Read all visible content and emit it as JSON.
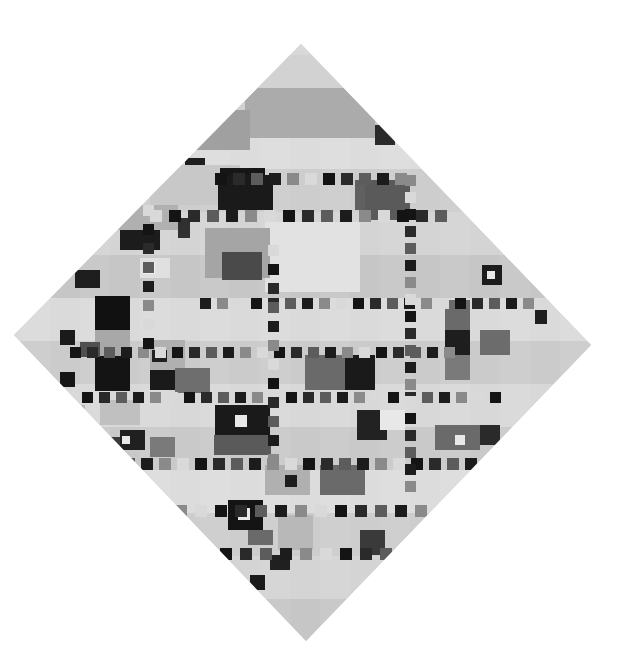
{
  "artwork": {
    "shape": "diamond",
    "style": "grayscale abstract grid of rectangles and small squares",
    "diamond_vertices": {
      "top": [
        301,
        44
      ],
      "right": [
        591,
        345
      ],
      "bottom": [
        306,
        641
      ],
      "left": [
        14,
        335
      ]
    },
    "base_color": "#cfcfcf",
    "palette": {
      "white": "#e6e6e6",
      "light": "#d6d6d6",
      "mid": "#b4b4b4",
      "gray": "#8c8c8c",
      "dark": "#5a5a5a",
      "black": "#1c1c1c"
    }
  },
  "blocks": [
    [
      228,
      55,
      150,
      60,
      "#d2d2d2"
    ],
    [
      245,
      88,
      130,
      50,
      "#ababab"
    ],
    [
      190,
      110,
      60,
      40,
      "#a0a0a0"
    ],
    [
      375,
      125,
      20,
      20,
      "#2a2a2a"
    ],
    [
      185,
      158,
      20,
      15,
      "#1e1e1e"
    ],
    [
      150,
      165,
      90,
      40,
      "#c8c8c8"
    ],
    [
      220,
      168,
      45,
      35,
      "#161616"
    ],
    [
      218,
      175,
      55,
      35,
      "#1a1a1a"
    ],
    [
      355,
      180,
      50,
      30,
      "#606060"
    ],
    [
      365,
      180,
      45,
      40,
      "#5a5a5a"
    ],
    [
      118,
      205,
      60,
      25,
      "#b0b0b0"
    ],
    [
      120,
      230,
      40,
      20,
      "#1c1c1c"
    ],
    [
      178,
      218,
      12,
      20,
      "#303030"
    ],
    [
      265,
      222,
      95,
      70,
      "#e2e2e2"
    ],
    [
      205,
      228,
      65,
      50,
      "#a5a5a5"
    ],
    [
      222,
      252,
      40,
      28,
      "#4a4a4a"
    ],
    [
      140,
      258,
      30,
      20,
      "#e0e0e0"
    ],
    [
      143,
      262,
      12,
      12,
      "#f0f0f0"
    ],
    [
      75,
      270,
      25,
      18,
      "#1e1e1e"
    ],
    [
      95,
      296,
      30,
      32,
      "#161616"
    ],
    [
      95,
      296,
      35,
      35,
      "#111111"
    ],
    [
      95,
      330,
      35,
      30,
      "#a8a8a8"
    ],
    [
      95,
      356,
      35,
      35,
      "#141414"
    ],
    [
      60,
      330,
      15,
      15,
      "#1a1a1a"
    ],
    [
      80,
      342,
      20,
      15,
      "#505050"
    ],
    [
      60,
      372,
      15,
      15,
      "#151515"
    ],
    [
      150,
      340,
      35,
      30,
      "#b0b0b0"
    ],
    [
      152,
      350,
      15,
      12,
      "#202020"
    ],
    [
      150,
      370,
      35,
      20,
      "#1a1a1a"
    ],
    [
      175,
      368,
      35,
      25,
      "#6e6e6e"
    ],
    [
      305,
      355,
      40,
      35,
      "#6a6a6a"
    ],
    [
      345,
      355,
      30,
      35,
      "#1a1a1a"
    ],
    [
      215,
      405,
      55,
      30,
      "#1a1a1a"
    ],
    [
      214,
      435,
      57,
      20,
      "#5a5a5a"
    ],
    [
      235,
      415,
      12,
      12,
      "#e8e8e8"
    ],
    [
      357,
      410,
      30,
      30,
      "#222222"
    ],
    [
      380,
      410,
      25,
      20,
      "#e8e8e8"
    ],
    [
      445,
      300,
      25,
      35,
      "#6a6a6a"
    ],
    [
      445,
      330,
      25,
      35,
      "#1e1e1e"
    ],
    [
      445,
      355,
      25,
      25,
      "#7a7a7a"
    ],
    [
      480,
      330,
      30,
      25,
      "#6c6c6c"
    ],
    [
      482,
      265,
      20,
      20,
      "#1c1c1c"
    ],
    [
      487,
      271,
      8,
      8,
      "#e8e8e8"
    ],
    [
      535,
      310,
      12,
      14,
      "#1e1e1e"
    ],
    [
      435,
      425,
      45,
      25,
      "#6a6a6a"
    ],
    [
      480,
      425,
      20,
      20,
      "#2a2a2a"
    ],
    [
      455,
      435,
      10,
      10,
      "#e8e8e8"
    ],
    [
      320,
      465,
      45,
      30,
      "#6a6a6a"
    ],
    [
      265,
      465,
      45,
      30,
      "#b0b0b0"
    ],
    [
      285,
      475,
      12,
      12,
      "#1e1e1e"
    ],
    [
      228,
      500,
      35,
      30,
      "#141414"
    ],
    [
      238,
      508,
      12,
      12,
      "#e8e8e8"
    ],
    [
      248,
      530,
      25,
      15,
      "#6a6a6a"
    ],
    [
      278,
      515,
      35,
      35,
      "#b8b8b8"
    ],
    [
      360,
      530,
      25,
      25,
      "#3a3a3a"
    ],
    [
      250,
      575,
      15,
      15,
      "#1a1a1a"
    ],
    [
      270,
      555,
      20,
      15,
      "#202020"
    ],
    [
      120,
      430,
      25,
      20,
      "#202020"
    ],
    [
      122,
      436,
      8,
      8,
      "#e8e8e8"
    ],
    [
      100,
      437,
      20,
      20,
      "#3a3a3a"
    ],
    [
      150,
      437,
      25,
      20,
      "#7a7a7a"
    ],
    [
      100,
      400,
      40,
      25,
      "#c0c0c0"
    ],
    [
      60,
      405,
      25,
      20,
      "#b8b8b8"
    ]
  ],
  "dot_rows": [
    {
      "y": 173,
      "x0": 215,
      "x1": 410,
      "size": 12,
      "step": 18
    },
    {
      "y": 210,
      "x0": 150,
      "x1": 440,
      "size": 12,
      "step": 19
    },
    {
      "y": 298,
      "x0": 200,
      "x1": 545,
      "size": 11,
      "step": 17
    },
    {
      "y": 347,
      "x0": 70,
      "x1": 450,
      "size": 11,
      "step": 17
    },
    {
      "y": 392,
      "x0": 65,
      "x1": 500,
      "size": 11,
      "step": 17
    },
    {
      "y": 458,
      "x0": 105,
      "x1": 480,
      "size": 12,
      "step": 18
    },
    {
      "y": 505,
      "x0": 175,
      "x1": 445,
      "size": 12,
      "step": 20
    },
    {
      "y": 548,
      "x0": 220,
      "x1": 410,
      "size": 12,
      "step": 20
    }
  ],
  "dot_cols": [
    {
      "x": 405,
      "y0": 175,
      "y1": 490,
      "size": 11,
      "step": 17
    },
    {
      "x": 268,
      "y0": 245,
      "y1": 470,
      "size": 11,
      "step": 19
    },
    {
      "x": 143,
      "y0": 205,
      "y1": 340,
      "size": 11,
      "step": 19
    }
  ]
}
